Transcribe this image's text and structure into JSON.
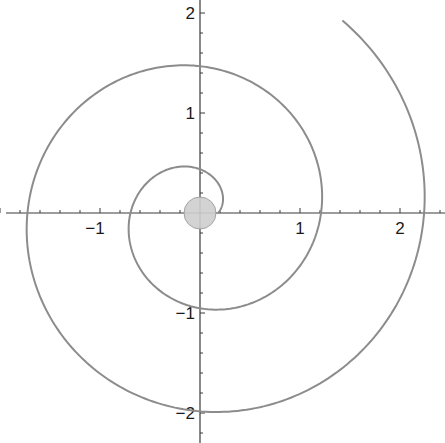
{
  "chart_data": {
    "type": "line",
    "title": "",
    "xlabel": "",
    "ylabel": "",
    "xlim": [
      -2.0,
      2.45
    ],
    "ylim": [
      -2.3,
      2.13
    ],
    "grid": false,
    "legend": null,
    "x_ticks": [
      {
        "value": -1,
        "label": "−1"
      },
      {
        "value": 1,
        "label": "1"
      },
      {
        "value": 2,
        "label": "2"
      }
    ],
    "y_ticks": [
      {
        "value": 2,
        "label": "2"
      },
      {
        "value": 1,
        "label": "1"
      },
      {
        "value": -1,
        "label": "−1"
      },
      {
        "value": -2,
        "label": "−2"
      }
    ],
    "minor_tick_step": 0.2,
    "series": [
      {
        "name": "spiral",
        "kind": "parametric-polar",
        "equation": "r = 0.18 + 0.164·θ",
        "theta_range": [
          0,
          13.5
        ],
        "color": "#8c8c8c",
        "axis_crossings": [
          {
            "x": 0.18,
            "y": 0
          },
          {
            "x": 0,
            "y": 0.5
          },
          {
            "x": -0.77,
            "y": 0
          },
          {
            "x": 0,
            "y": -1.0
          },
          {
            "x": 1.22,
            "y": 0
          },
          {
            "x": 0,
            "y": 1.5
          },
          {
            "x": -1.77,
            "y": 0
          },
          {
            "x": 0,
            "y": -2.02
          },
          {
            "x": 2.24,
            "y": 0
          }
        ],
        "end_point": {
          "x": 1.42,
          "y": 1.96
        }
      }
    ],
    "annotations": [
      {
        "type": "circle",
        "name": "origin-marker",
        "center": {
          "x": 0,
          "y": 0
        },
        "radius": 0.16,
        "color": "#cfcfcf"
      }
    ]
  }
}
